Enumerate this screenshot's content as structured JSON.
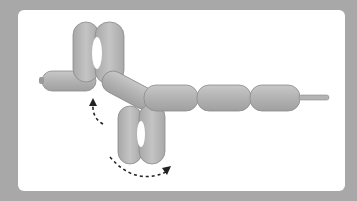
{
  "diagram": {
    "colors": {
      "frame": "#a8a8a8",
      "panel": "#ffffff",
      "balloon": "#b4b4b4",
      "balloon_edge": "#8a8a8a",
      "arrow": "#222222"
    },
    "segments": 9,
    "arrows": 2
  }
}
